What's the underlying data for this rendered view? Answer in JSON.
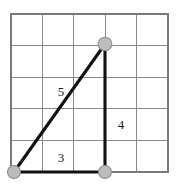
{
  "figure": {
    "width": 179,
    "height": 188,
    "background_color": "#ffffff"
  },
  "grid": {
    "name": "square-grid",
    "columns": 5,
    "rows": 5,
    "origin_x": 11,
    "origin_y": 14,
    "cell_width": 31.4,
    "cell_height": 31.6,
    "line_color": "#8a8a8a",
    "border_color": "#7a7a7a"
  },
  "triangle": {
    "name": "right-triangle",
    "stroke_color": "#111111",
    "stroke_width": 3.1,
    "vertices": [
      {
        "name": "bottom-left-vertex",
        "x": 14,
        "y": 172
      },
      {
        "name": "top-right-vertex",
        "x": 105,
        "y": 44
      },
      {
        "name": "bottom-right-vertex",
        "x": 105,
        "y": 172
      }
    ],
    "vertex_marker": {
      "radius": 6.5,
      "fill_color": "#bcbcbc",
      "stroke_color": "#8d8d8d"
    },
    "sides": [
      {
        "name": "hypotenuse",
        "label": "5",
        "label_x": 61,
        "label_y": 93,
        "from": "bottom-left-vertex",
        "to": "top-right-vertex"
      },
      {
        "name": "vertical-leg",
        "label": "4",
        "label_x": 121,
        "label_y": 126,
        "from": "top-right-vertex",
        "to": "bottom-right-vertex"
      },
      {
        "name": "horizontal-leg",
        "label": "3",
        "label_x": 61,
        "label_y": 159,
        "from": "bottom-left-vertex",
        "to": "bottom-right-vertex"
      }
    ]
  }
}
